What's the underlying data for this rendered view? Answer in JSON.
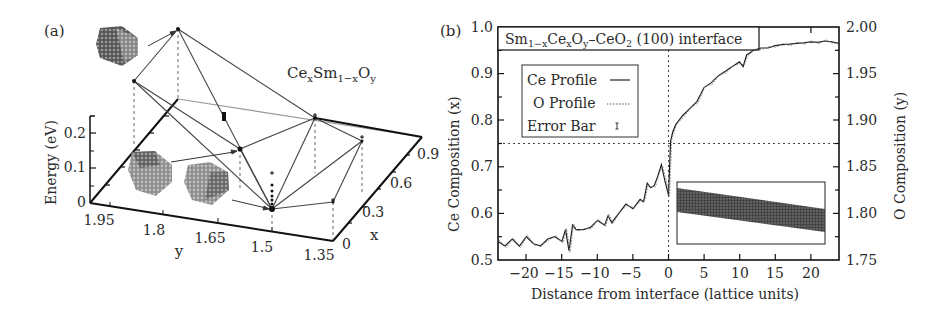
{
  "figure": {
    "panels": [
      "(a)",
      "(b)"
    ]
  },
  "chart_data": [
    {
      "panel": "(a)",
      "type": "scatter",
      "subtype": "3d-convex-hull",
      "title": "CexSm1-xOy",
      "title_parts": {
        "base1": "Ce",
        "sub1": "x",
        "base2": "Sm",
        "sub2": "1−x",
        "base3": "O",
        "sub3": "y"
      },
      "zlabel": "Energy (eV)",
      "xlabel": "x",
      "ylabel": "y",
      "z_ticks": [
        "0",
        "0.1",
        "0.2"
      ],
      "y_ticks": [
        "1.95",
        "1.8",
        "1.65",
        "1.5",
        "1.35"
      ],
      "x_ticks": [
        "0",
        "0.3",
        "0.6",
        "0.9"
      ],
      "zlim": [
        0,
        0.25
      ],
      "ylim": [
        1.35,
        1.95
      ],
      "xlim": [
        0,
        1
      ],
      "hull_vertices_screen": [
        {
          "id": "apex",
          "px": [
            178,
            29
          ]
        },
        {
          "id": "left",
          "px": [
            134,
            81
          ]
        },
        {
          "id": "mid",
          "px": [
            240,
            149
          ]
        },
        {
          "id": "low",
          "px": [
            272,
            209
          ]
        },
        {
          "id": "right-top",
          "px": [
            315,
            118
          ]
        },
        {
          "id": "right",
          "px": [
            362,
            141
          ]
        },
        {
          "id": "right-low",
          "px": [
            333,
            202
          ]
        }
      ],
      "annotations": [
        "nanoparticle structure inset (top-left)",
        "nanoparticle structure inset (lower-left)",
        "nanoparticle structure inset (lower-middle)"
      ]
    },
    {
      "panel": "(b)",
      "type": "line",
      "title": "Sm1−xCexOy–CeO2 (100) interface",
      "title_parts": {
        "a": "Sm",
        "a_sub": "1−x",
        "b": "Ce",
        "b_sub": "x",
        "c": "O",
        "c_sub": "y",
        "d": "–CeO",
        "d_sub": "2",
        "e": " (100) interface"
      },
      "xlabel": "Distance from interface (lattice units)",
      "ylabel": "Ce Composition (x)",
      "y2label": "O Composition (y)",
      "x_ticks": [
        "−20",
        "−15",
        "−10",
        "−5",
        "0",
        "5",
        "10",
        "15",
        "20"
      ],
      "x_tick_values": [
        -20,
        -15,
        -10,
        -5,
        0,
        5,
        10,
        15,
        20
      ],
      "y_ticks": [
        "0.5",
        "0.6",
        "0.7",
        "0.8",
        "0.9",
        "1.0"
      ],
      "y_tick_values": [
        0.5,
        0.6,
        0.7,
        0.8,
        0.9,
        1.0
      ],
      "y2_ticks": [
        "1.75",
        "1.80",
        "1.85",
        "1.90",
        "1.95",
        "2.00"
      ],
      "y2_tick_values": [
        1.75,
        1.8,
        1.85,
        1.9,
        1.95,
        2.0
      ],
      "xlim": [
        -24,
        24
      ],
      "ylim": [
        0.5,
        1.0
      ],
      "y2lim": [
        1.75,
        2.0
      ],
      "reference_lines": {
        "vertical_x": 0,
        "horizontal_y": 0.75
      },
      "legend": {
        "position": "upper-left",
        "entries": [
          {
            "label": "Ce Profile",
            "style": "solid"
          },
          {
            "label": "O Profile",
            "style": "dotted"
          },
          {
            "label": "Error Bar",
            "style": "errorbar"
          }
        ]
      },
      "series": [
        {
          "name": "Ce Profile",
          "x": [
            -24,
            -23,
            -22,
            -21,
            -20,
            -19,
            -18,
            -17,
            -16,
            -15,
            -14.5,
            -14,
            -13.5,
            -13,
            -12,
            -11,
            -10,
            -9,
            -8.5,
            -8,
            -7,
            -6,
            -5,
            -4,
            -3.5,
            -3,
            -2.5,
            -2,
            -1.5,
            -1,
            -0.5,
            0,
            0.3,
            0.6,
            1,
            2,
            3,
            4,
            5,
            6,
            7,
            8,
            9,
            10,
            10.5,
            11,
            12,
            13,
            14,
            15,
            16,
            17,
            18,
            19,
            20,
            21,
            22,
            23,
            24
          ],
          "values": [
            0.54,
            0.53,
            0.545,
            0.53,
            0.55,
            0.535,
            0.53,
            0.545,
            0.55,
            0.54,
            0.565,
            0.52,
            0.575,
            0.565,
            0.565,
            0.57,
            0.585,
            0.575,
            0.595,
            0.58,
            0.6,
            0.62,
            0.61,
            0.63,
            0.625,
            0.665,
            0.655,
            0.66,
            0.68,
            0.705,
            0.67,
            0.64,
            0.755,
            0.775,
            0.79,
            0.81,
            0.825,
            0.84,
            0.87,
            0.88,
            0.895,
            0.905,
            0.915,
            0.925,
            0.915,
            0.94,
            0.95,
            0.955,
            0.955,
            0.96,
            0.962,
            0.963,
            0.965,
            0.966,
            0.968,
            0.967,
            0.97,
            0.968,
            0.965
          ]
        },
        {
          "name": "O Profile",
          "axis": "y2",
          "note": "closely tracks Ce profile on the right axis scale"
        }
      ],
      "inset": {
        "description": "interface structure snapshot (band)"
      }
    }
  ]
}
